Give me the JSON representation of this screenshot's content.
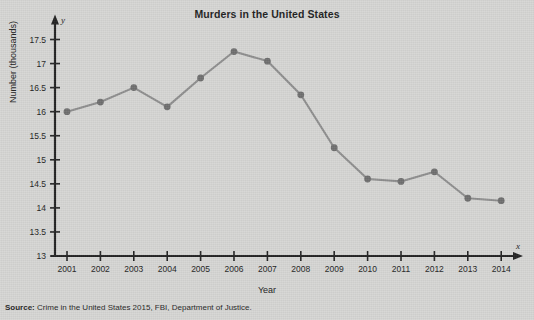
{
  "chart_data": {
    "type": "line",
    "title": "Murders in the United States",
    "xlabel": "Year",
    "ylabel": "Number (thousands)",
    "x_axis_variable": "x",
    "y_axis_variable": "y",
    "categories": [
      "2001",
      "2002",
      "2003",
      "2004",
      "2005",
      "2006",
      "2007",
      "2008",
      "2009",
      "2010",
      "2011",
      "2012",
      "2013",
      "2014"
    ],
    "values": [
      16.0,
      16.2,
      16.5,
      16.1,
      16.7,
      17.25,
      17.05,
      16.35,
      15.25,
      14.6,
      14.55,
      14.75,
      14.2,
      14.15
    ],
    "ylim": [
      13,
      17.5
    ],
    "ytick_labels": [
      "17.5",
      "17",
      "16.5",
      "16",
      "15.5",
      "15",
      "14.5",
      "14",
      "13.5",
      "13"
    ],
    "ytick_values": [
      17.5,
      17,
      16.5,
      16,
      15.5,
      15,
      14.5,
      14,
      13.5,
      13
    ],
    "grid": false,
    "legend": "none",
    "series_color": "#8e8e8e",
    "marker_color": "#6f6f6f",
    "axis_color": "#222222"
  },
  "source": {
    "label": "Source:",
    "text": " Crime in the United States 2015, FBI, Department of Justice."
  },
  "page": {
    "background_color": "#d6d6d4"
  }
}
